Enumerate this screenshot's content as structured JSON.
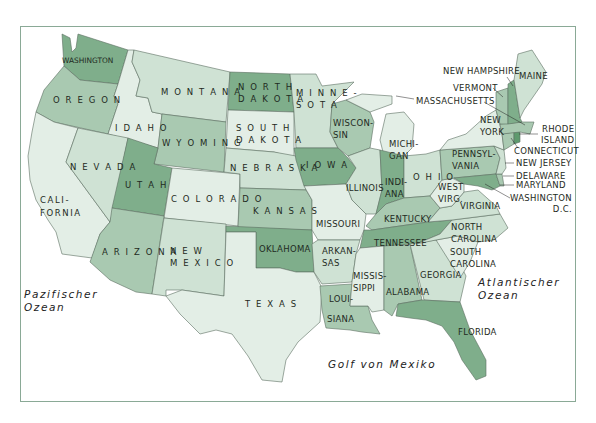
{
  "map": {
    "colors": {
      "very_light": "#e3eee6",
      "light": "#cfe2d4",
      "medium": "#a9c9b1",
      "dark": "#7fae8b",
      "darkest": "#5e9a6e",
      "border": "#5c6e62",
      "water": "#ffffff",
      "frame": "#8aa996"
    },
    "states": {
      "washington": "WASHINGTON",
      "oregon": "O R E G O N",
      "california": "CALI-\nFORNIA",
      "idaho": "I D A H O",
      "nevada": "N E V A D A",
      "montana": "M O N T A N A",
      "wyoming": "W Y O M I N G",
      "utah": "U T A H",
      "colorado": "C O L O R A D O",
      "arizona": "A R I Z O N A",
      "new_mexico": "N E W\nM E X I C O",
      "north_dakota": "N O R T H\nD A K O T A",
      "south_dakota": "S O U T H\nD A K O T A",
      "nebraska": "N E B R A S K A",
      "kansas": "K A N S A S",
      "oklahoma": "OKLAHOMA",
      "texas": "T E X A S",
      "minnesota": "M I N N E -\nS O T A",
      "iowa": "I O W A",
      "missouri": "MISSOURI",
      "arkansas": "ARKAN-\nSAS",
      "louisiana_1": "LOUI-",
      "louisiana_2": "SIANA",
      "wisconsin": "WISCON-\nSIN",
      "illinois": "ILLINOIS",
      "michigan": "MICHI-\nGAN",
      "indiana": "INDI-\nANA",
      "ohio": "O H I O",
      "kentucky": "KENTUCKY",
      "tennessee": "TENNESSEE",
      "mississippi": "MISSIS-\nSIPPI",
      "alabama": "ALABAMA",
      "georgia": "GEORGIA",
      "florida": "FLORIDA",
      "south_carolina": "SOUTH\nCAROLINA",
      "north_carolina": "NORTH\nCAROLINA",
      "virginia": "VIRGINIA",
      "west_virginia": "WEST\nVIRG.",
      "pennsylvania": "PENNSYL-\nVANIA",
      "new_york": "NEW\nYORK",
      "maine": "MAINE",
      "new_hampshire": "NEW HAMPSHIRE",
      "vermont": "VERMONT",
      "massachusetts": "MASSACHUSETTS",
      "rhode_island": "RHODE\nISLAND",
      "connecticut": "CONNECTICUT",
      "new_jersey": "NEW JERSEY",
      "delaware": "DELAWARE",
      "maryland": "MARYLAND",
      "washington_dc": "WASHINGTON\nD.C."
    },
    "water_bodies": {
      "pacific": "Pazifischer\nOzean",
      "atlantic": "Atlantischer\nOzean",
      "gulf": "Golf von Mexiko"
    }
  }
}
